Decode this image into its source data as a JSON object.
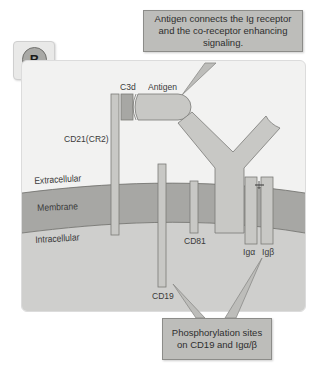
{
  "figure": {
    "panel_letter": "B",
    "callouts": {
      "top": "Antigen connects the Ig receptor and the co-receptor enhancing signaling.",
      "bottom": "Phosphorylation sites on CD19 and Igα/β"
    },
    "region_labels": {
      "extracellular": "Extracellular",
      "membrane": "Membrane",
      "intracellular": "Intracellular"
    },
    "molecule_labels": {
      "c3d": "C3d",
      "antigen": "Antigen",
      "cd21": "CD21(CR2)",
      "cd81": "CD81",
      "cd19": "CD19",
      "ig_alpha": "Igα",
      "ig_beta": "Igβ"
    },
    "colors": {
      "panel_bg": "#f2f2f1",
      "extracellular": "#f2f2f1",
      "membrane": "#a7a7a4",
      "intracellular": "#cfcfcd",
      "protein_fill": "#c8c8c5",
      "protein_stroke": "#7a7a77",
      "callout_fill": "#bdbdba"
    }
  }
}
